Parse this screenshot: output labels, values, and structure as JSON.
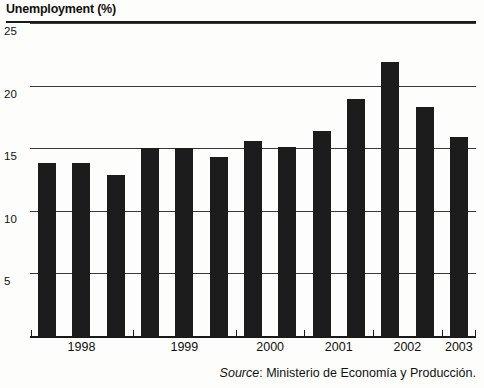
{
  "chart_data": {
    "type": "bar",
    "title": "Unemployment (%)",
    "xlabel": "",
    "ylabel": "",
    "ylim": [
      0,
      25
    ],
    "yticks": [
      25,
      20,
      15,
      10,
      5
    ],
    "grid": true,
    "legend": null,
    "bar_color": "#1c1c1c",
    "categories": [
      "1998 H1",
      "1998 H2",
      "1998 H3",
      "1999 H1",
      "1999 H2",
      "1999 H3",
      "2000 H1",
      "2000 H2",
      "2001 H1",
      "2001 H2",
      "2002 H1",
      "2002 H2",
      "2003 H1"
    ],
    "values": [
      13.8,
      13.8,
      12.9,
      15.0,
      15.0,
      14.3,
      15.6,
      15.1,
      16.4,
      18.9,
      21.9,
      18.3,
      15.9
    ],
    "year_groups": [
      {
        "label": "1998",
        "count": 3
      },
      {
        "label": "1999",
        "count": 3
      },
      {
        "label": "2000",
        "count": 2
      },
      {
        "label": "2001",
        "count": 2
      },
      {
        "label": "2002",
        "count": 2
      },
      {
        "label": "2003",
        "count": 1
      }
    ],
    "annotations": []
  },
  "axis": {
    "y_labels": [
      "25",
      "20",
      "15",
      "10",
      "5"
    ],
    "x_labels": [
      "1998",
      "1999",
      "2000",
      "2001",
      "2002",
      "2003"
    ]
  },
  "source": {
    "word": "Source",
    "text": ": Ministerio de Economía y Producción."
  }
}
